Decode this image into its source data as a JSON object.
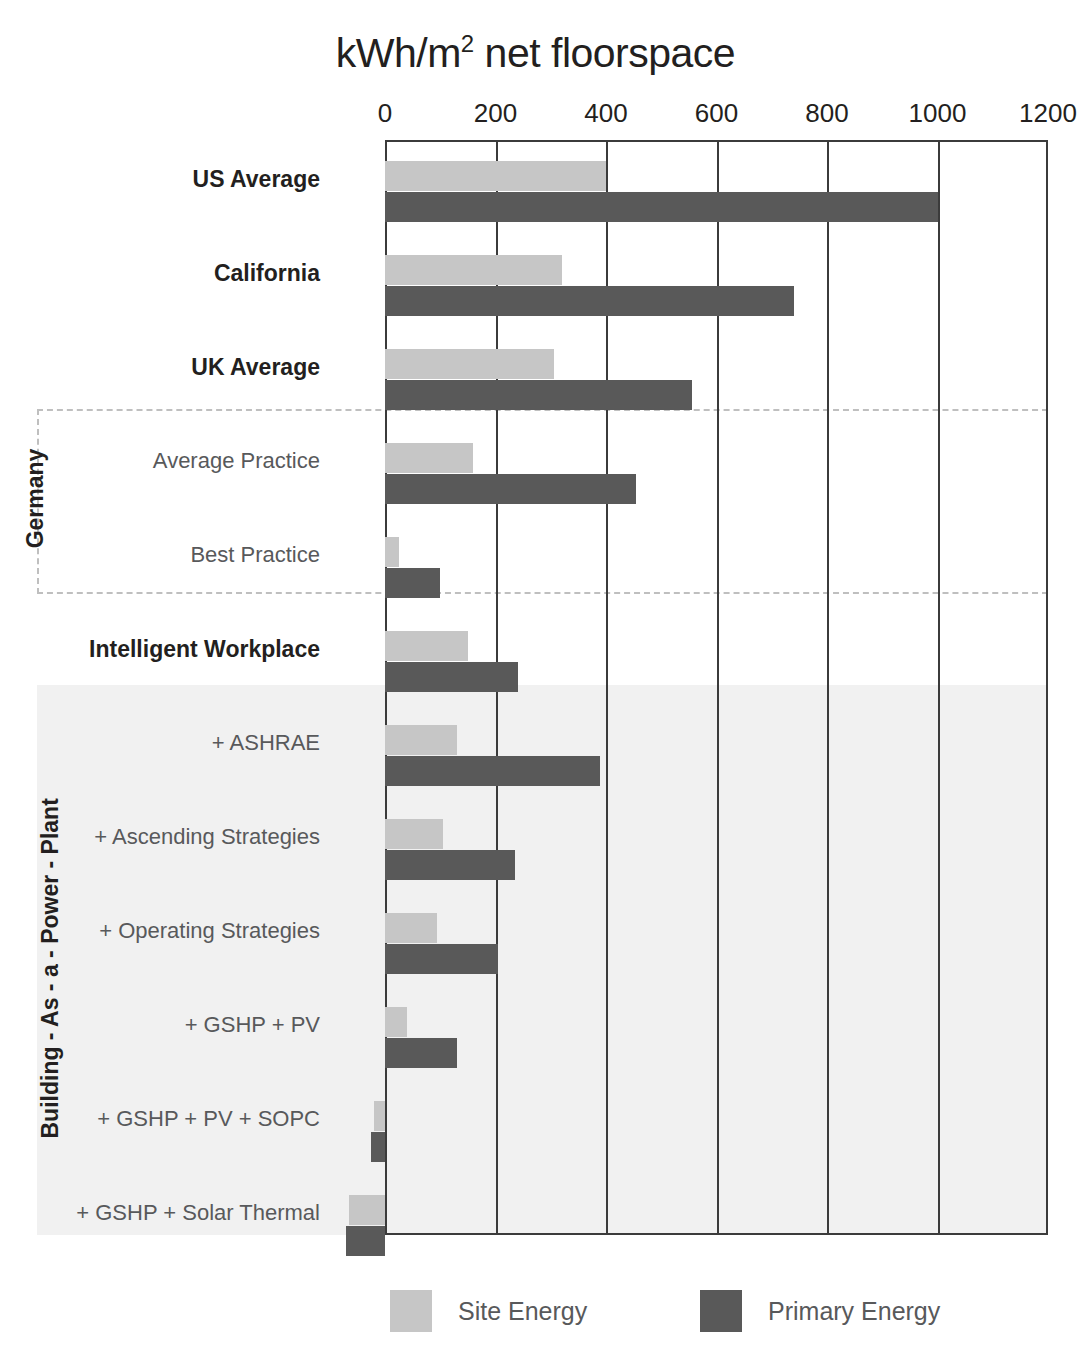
{
  "chart_data": {
    "type": "bar",
    "orientation": "horizontal",
    "title_main": "kWh/m",
    "title_sup": "2",
    "title_tail": " net floorspace",
    "xlabel": "",
    "ylabel": "",
    "xlim": [
      0,
      1200
    ],
    "xticks": [
      0,
      200,
      400,
      600,
      800,
      1000,
      1200
    ],
    "xtick_labels": [
      "0",
      "200",
      "400",
      "600",
      "800",
      "1000",
      "1200"
    ],
    "grid": true,
    "legend_position": "bottom",
    "series": [
      {
        "name": "Site Energy",
        "color": "#c6c6c6",
        "values": [
          400,
          320,
          305,
          160,
          25,
          150,
          130,
          105,
          95,
          40,
          -20,
          -65
        ]
      },
      {
        "name": "Primary Energy",
        "color": "#595959",
        "values": [
          1000,
          740,
          555,
          455,
          100,
          240,
          390,
          235,
          205,
          130,
          -25,
          -70
        ]
      }
    ],
    "categories": [
      "US Average",
      "California",
      "UK Average",
      "Average Practice",
      "Best Practice",
      "Intelligent Workplace",
      "+ ASHRAE",
      "+ Ascending Strategies",
      "+ Operating Strategies",
      "+ GSHP + PV",
      "+ GSHP + PV + SOPC",
      "+ GSHP + Solar Thermal"
    ],
    "category_styles": [
      "bold",
      "bold",
      "bold",
      "light",
      "light",
      "bold",
      "light",
      "light",
      "light",
      "light",
      "light",
      "light"
    ],
    "group_labels": [
      {
        "name": "Germany",
        "rows": [
          3,
          4
        ]
      },
      {
        "name": "Building - As - a - Power - Plant",
        "rows": [
          6,
          7,
          8,
          9,
          10,
          11
        ]
      }
    ]
  },
  "legend": {
    "items": [
      {
        "label": "Site Energy",
        "color": "#c6c6c6"
      },
      {
        "label": "Primary Energy",
        "color": "#595959"
      }
    ]
  },
  "groups": {
    "germany": "Germany",
    "bapp": "Building - As - a - Power - Plant"
  },
  "colors": {
    "site": "#c6c6c6",
    "primary": "#595959",
    "axis": "#3b3b3b",
    "shade": "#f1f1f1",
    "dashed": "#bfbfbf",
    "text": "#231f20",
    "text_light": "#58595b"
  }
}
